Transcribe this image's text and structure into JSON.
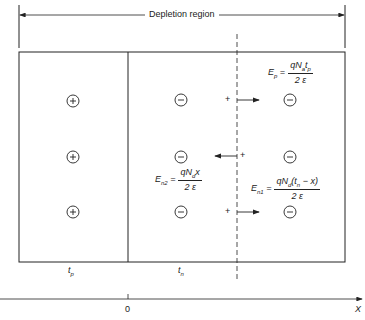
{
  "title": "Depletion region",
  "regions": [
    {
      "label": "t",
      "sub": "p",
      "charge": "+"
    },
    {
      "label": "t",
      "sub": "n",
      "charge": "−"
    }
  ],
  "axis": {
    "origin_label": "0",
    "axis_label": "X"
  },
  "equations": {
    "ep": {
      "lhs": "E",
      "lhs_sub": "p",
      "num": "qN",
      "num_sub": "a",
      "num_rest": "t",
      "num_rest_sub": "p",
      "den": "2 ε"
    },
    "en2": {
      "lhs": "E",
      "lhs_sub": "n2",
      "num": "qN",
      "num_sub": "d",
      "num_rest": "x",
      "den": "2 ε"
    },
    "en1": {
      "lhs": "E",
      "lhs_sub": "n1",
      "num": "qN",
      "num_sub": "d",
      "num_rest": "(t",
      "num_rest_sub": "n",
      "num_tail": " − x)",
      "den": "2 ε"
    }
  },
  "test_charge": "+",
  "colors": {
    "line": "#222222",
    "background": "#ffffff"
  }
}
